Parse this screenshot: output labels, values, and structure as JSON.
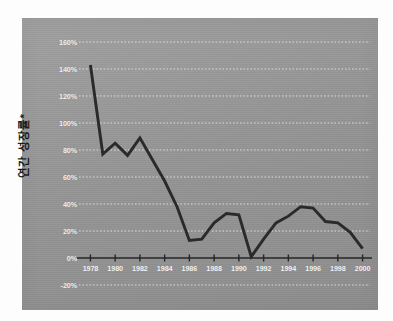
{
  "chart_data": {
    "type": "line",
    "title": "",
    "subtitle": "",
    "xlabel": "",
    "ylabel": "연간 성장률*",
    "x": [
      1978,
      1979,
      1980,
      1981,
      1982,
      1983,
      1984,
      1985,
      1986,
      1987,
      1988,
      1989,
      1990,
      1991,
      1992,
      1993,
      1994,
      1995,
      1996,
      1997,
      1998,
      1999,
      2000
    ],
    "values": [
      143,
      77,
      85,
      76,
      89,
      73,
      57,
      38,
      13,
      14,
      26,
      33,
      32,
      1,
      14,
      26,
      31,
      38,
      37,
      27,
      26,
      19,
      7
    ],
    "series": [
      {
        "name": "연간 성장률",
        "values": [
          143,
          77,
          85,
          76,
          89,
          73,
          57,
          38,
          13,
          14,
          26,
          33,
          32,
          1,
          14,
          26,
          31,
          38,
          37,
          27,
          26,
          19,
          7
        ]
      }
    ],
    "xlim": [
      1977.4,
      2000.6
    ],
    "ylim": [
      -20,
      160
    ],
    "ytick_labels": [
      "160%",
      "140%",
      "120%",
      "100%",
      "80%",
      "60%",
      "40%",
      "20%",
      "0%",
      "-20%"
    ],
    "ytick_values": [
      160,
      140,
      120,
      100,
      80,
      60,
      40,
      20,
      0,
      -20
    ],
    "xtick_labels": [
      "1978",
      "1980",
      "1982",
      "1984",
      "1986",
      "1988",
      "1990",
      "1992",
      "1994",
      "1996",
      "1998",
      "2000"
    ],
    "xtick_values": [
      1978,
      1980,
      1982,
      1984,
      1986,
      1988,
      1990,
      1992,
      1994,
      1996,
      1998,
      2000
    ],
    "grid": true,
    "grid_axis": "y",
    "legend": "none",
    "colors": {
      "panel_background": "#9b9b9b",
      "page_background": "#fdfdfd",
      "gridline": "#f0f0f0",
      "line": "#2a2a2a",
      "axis": "#262626",
      "tick_label": "#f2f2f2",
      "axis_title": "#1c1c1c"
    }
  }
}
